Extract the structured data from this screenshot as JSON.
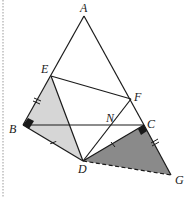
{
  "diagram": {
    "type": "geometry-figure",
    "points": {
      "A": {
        "label": "A",
        "x": 84,
        "y": 16
      },
      "B": {
        "label": "B",
        "x": 23,
        "y": 125
      },
      "C": {
        "label": "C",
        "x": 144,
        "y": 125
      },
      "D": {
        "label": "D",
        "x": 83,
        "y": 161
      },
      "E": {
        "label": "E",
        "x": 51,
        "y": 76
      },
      "F": {
        "label": "F",
        "x": 131,
        "y": 99
      },
      "G": {
        "label": "G",
        "x": 171,
        "y": 175
      },
      "N": {
        "label": "N",
        "x": 113,
        "y": 125
      }
    },
    "labels": {
      "A": "A",
      "B": "B",
      "C": "C",
      "D": "D",
      "E": "E",
      "F": "F",
      "G": "G",
      "N": "N"
    },
    "segments": [
      "AB",
      "AC",
      "EF",
      "BC",
      "BD",
      "CD",
      "ED",
      "DF",
      "DG-dashed",
      "CG"
    ],
    "shaded_regions": [
      {
        "name": "triangle-EBD",
        "color": "#d6d6d6"
      },
      {
        "name": "triangle-DCG",
        "color": "#8a8a8a"
      }
    ],
    "right_angles": [
      "B",
      "C"
    ],
    "tick_marks": {
      "single": [
        "BD",
        "CD"
      ],
      "double": [
        "EB",
        "CG"
      ]
    },
    "colors": {
      "line": "#1a1a1a",
      "light_fill": "#d6d6d6",
      "dark_fill": "#8a8a8a",
      "border": "#9a9a9a"
    }
  }
}
